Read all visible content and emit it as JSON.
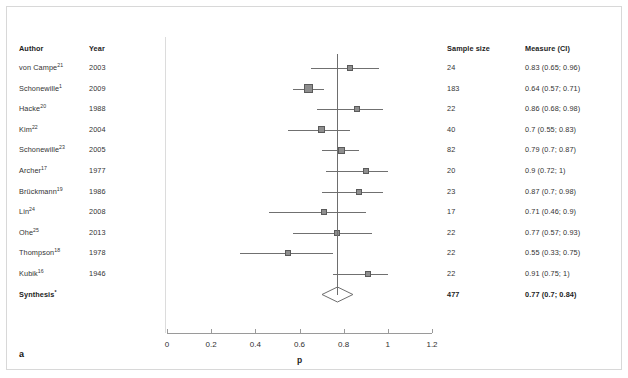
{
  "figure": {
    "panel_label": "a",
    "axis_title": "p",
    "columns": {
      "author": "Author",
      "year": "Year",
      "sample_size": "Sample size",
      "measure": "Measure (CI)"
    }
  },
  "chart_data": {
    "type": "forest",
    "title": "",
    "xlabel": "p",
    "ylabel": "",
    "xlim": [
      0,
      1.2
    ],
    "xticks": [
      "0",
      "0.2",
      "0.4",
      "0.6",
      "0.8",
      "1",
      "1.2"
    ],
    "xtick_values": [
      0,
      0.2,
      0.4,
      0.6,
      0.8,
      1,
      1.2
    ],
    "grid": false,
    "legend": "none",
    "reference_line": 0.77,
    "studies": [
      {
        "author": "von Campe",
        "ref": "21",
        "year": "2003",
        "n": "24",
        "n_value": 24,
        "measure": "0.83 (0.65; 0.96)",
        "estimate": 0.83,
        "ci_low": 0.65,
        "ci_high": 0.96
      },
      {
        "author": "Schonewille",
        "ref": "1",
        "year": "2009",
        "n": "183",
        "n_value": 183,
        "measure": "0.64 (0.57; 0.71)",
        "estimate": 0.64,
        "ci_low": 0.57,
        "ci_high": 0.71
      },
      {
        "author": "Hacke",
        "ref": "20",
        "year": "1988",
        "n": "22",
        "n_value": 22,
        "measure": "0.86 (0.68; 0.98)",
        "estimate": 0.86,
        "ci_low": 0.68,
        "ci_high": 0.98
      },
      {
        "author": "Kim",
        "ref": "22",
        "year": "2004",
        "n": "40",
        "n_value": 40,
        "measure": "0.7 (0.55; 0.83)",
        "estimate": 0.7,
        "ci_low": 0.55,
        "ci_high": 0.83
      },
      {
        "author": "Schonewille",
        "ref": "23",
        "year": "2005",
        "n": "82",
        "n_value": 82,
        "measure": "0.79 (0.7; 0.87)",
        "estimate": 0.79,
        "ci_low": 0.7,
        "ci_high": 0.87
      },
      {
        "author": "Archer",
        "ref": "17",
        "year": "1977",
        "n": "20",
        "n_value": 20,
        "measure": "0.9 (0.72; 1)",
        "estimate": 0.9,
        "ci_low": 0.72,
        "ci_high": 1.0
      },
      {
        "author": "Brückmann",
        "ref": "19",
        "year": "1986",
        "n": "23",
        "n_value": 23,
        "measure": "0.87 (0.7; 0.98)",
        "estimate": 0.87,
        "ci_low": 0.7,
        "ci_high": 0.98
      },
      {
        "author": "Lin",
        "ref": "24",
        "year": "2008",
        "n": "17",
        "n_value": 17,
        "measure": "0.71 (0.46; 0.9)",
        "estimate": 0.71,
        "ci_low": 0.46,
        "ci_high": 0.9
      },
      {
        "author": "Ohe",
        "ref": "25",
        "year": "2013",
        "n": "22",
        "n_value": 22,
        "measure": "0.77 (0.57; 0.93)",
        "estimate": 0.77,
        "ci_low": 0.57,
        "ci_high": 0.93
      },
      {
        "author": "Thompson",
        "ref": "18",
        "year": "1978",
        "n": "22",
        "n_value": 22,
        "measure": "0.55 (0.33; 0.75)",
        "estimate": 0.55,
        "ci_low": 0.33,
        "ci_high": 0.75
      },
      {
        "author": "Kubik",
        "ref": "16",
        "year": "1946",
        "n": "22",
        "n_value": 22,
        "measure": "0.91 (0.75; 1)",
        "estimate": 0.91,
        "ci_low": 0.75,
        "ci_high": 1.0
      }
    ],
    "synthesis": {
      "author": "Synthesis",
      "ref": "*",
      "year": "",
      "n": "477",
      "n_value": 477,
      "measure": "0.77 (0.7; 0.84)",
      "estimate": 0.77,
      "ci_low": 0.7,
      "ci_high": 0.84
    }
  }
}
